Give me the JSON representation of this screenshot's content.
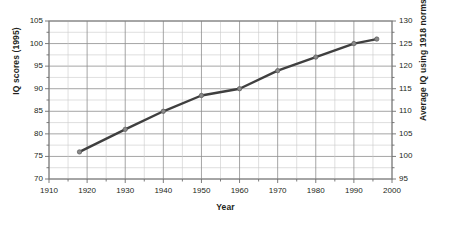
{
  "chart_data": {
    "type": "line",
    "title": "",
    "xlabel": "Year",
    "ylabel": "IQ scores (1995)",
    "ylabel_right": "Average IQ using 1918 norms",
    "x": [
      1918,
      1930,
      1940,
      1950,
      1960,
      1970,
      1980,
      1990,
      1996
    ],
    "values": [
      76,
      81,
      85,
      88.5,
      90,
      94,
      97,
      100,
      101
    ],
    "series": [
      {
        "name": "IQ scores (1995)",
        "values": [
          76,
          81,
          85,
          88.5,
          90,
          94,
          97,
          100,
          101
        ]
      }
    ],
    "xlim": [
      1910,
      2000
    ],
    "ylim": [
      70,
      105
    ],
    "ylim_right": [
      95,
      130
    ],
    "xticks": [
      1910,
      1920,
      1930,
      1940,
      1950,
      1960,
      1970,
      1980,
      1990,
      2000
    ],
    "yticks": [
      70,
      75,
      80,
      85,
      90,
      95,
      100,
      105
    ],
    "yticks_right": [
      95,
      100,
      105,
      110,
      115,
      120,
      125,
      130
    ],
    "grid": true,
    "legend": "none",
    "line_color": "#3f3f3f",
    "grid_color": "#9a9a9a",
    "marker_color": "#8a8a8a"
  },
  "axes": {
    "left_title": "IQ scores (1995)",
    "right_title": "Average IQ using 1918 norms",
    "bottom_title": "Year"
  },
  "ticks": {
    "left": [
      "105",
      "100",
      "95",
      "90",
      "85",
      "80",
      "75",
      "70"
    ],
    "right": [
      "130",
      "125",
      "120",
      "115",
      "110",
      "105",
      "100",
      "95"
    ],
    "bottom": [
      "1910",
      "1920",
      "1930",
      "1940",
      "1950",
      "1960",
      "1970",
      "1980",
      "1990",
      "2000"
    ]
  }
}
